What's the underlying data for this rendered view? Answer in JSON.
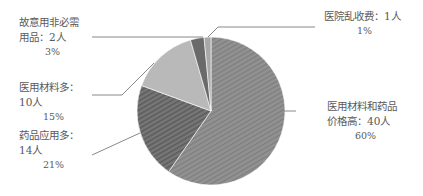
{
  "chart_data": {
    "type": "pie",
    "title": "",
    "start_angle_deg": 0,
    "direction": "clockwise",
    "legend": "none",
    "slices": [
      {
        "name": "医用材料和药品价格高",
        "count": 40,
        "count_label": "40人",
        "percent": 60,
        "percent_label": "60%",
        "color": "#8c8c8c",
        "pattern": "stripe-light"
      },
      {
        "name": "药品应用多",
        "count": 14,
        "count_label": "14人",
        "percent": 21,
        "percent_label": "21%",
        "color": "#6e6e6e",
        "pattern": "stripe-dark"
      },
      {
        "name": "医用材料多",
        "count": 10,
        "count_label": "10人",
        "percent": 15,
        "percent_label": "15%",
        "color": "#b9b9b9",
        "pattern": "none"
      },
      {
        "name": "故意用非必需用品",
        "count": 2,
        "count_label": "2人",
        "percent": 3,
        "percent_label": "3%",
        "color": "#6a6a6a",
        "pattern": "none"
      },
      {
        "name": "医院乱收费",
        "count": 1,
        "count_label": "1人",
        "percent": 1,
        "percent_label": "1%",
        "color": "#a8a8a8",
        "pattern": "none"
      }
    ],
    "categories": [
      "医用材料和药品价格高",
      "药品应用多",
      "医用材料多",
      "故意用非必需用品",
      "医院乱收费"
    ],
    "values": [
      40,
      14,
      10,
      2,
      1
    ]
  },
  "labels": {
    "s0": {
      "line1": "医用材料和药品",
      "line2": "价格高：40人",
      "pct": "60%"
    },
    "s1": {
      "line1": "药品应用多：",
      "line2": "14人",
      "pct": "21%"
    },
    "s2": {
      "line1": "医用材料多：",
      "line2": "10人",
      "pct": "15%"
    },
    "s3": {
      "line1": "故意用非必需",
      "line2": "用品：2人",
      "pct": "3%"
    },
    "s4": {
      "line1": "医院乱收费：1人",
      "pct": "1%"
    }
  }
}
